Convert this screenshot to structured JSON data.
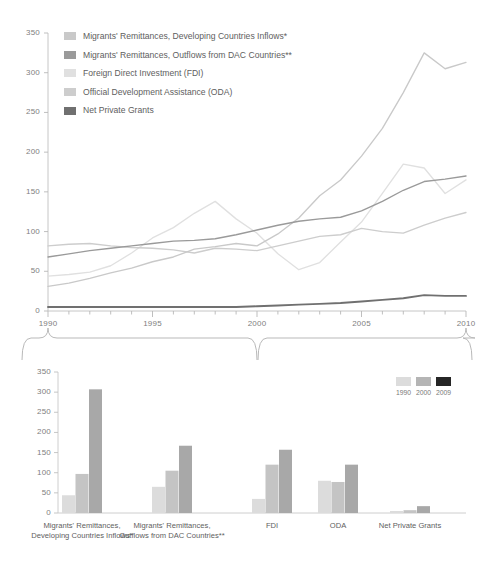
{
  "figure": {
    "kind": "two-panel-financial-flows-figure",
    "panels": 2
  },
  "legend_top": {
    "items": [
      {
        "label": "Migrants' Remittances, Developing Countries Inflows*",
        "color": "#c9c9c9",
        "name": "remittances-inflows"
      },
      {
        "label": "Migrants' Remittances, Outflows from DAC Countries**",
        "color": "#9a9a9a",
        "name": "remittances-outflows"
      },
      {
        "label": "Foreign Direct Investment (FDI)",
        "color": "#e0e0e0",
        "name": "fdi"
      },
      {
        "label": "Official Development Assistance (ODA)",
        "color": "#cdcdcd",
        "name": "oda"
      },
      {
        "label": "Net Private Grants",
        "color": "#707070",
        "name": "net-private-grants"
      }
    ]
  },
  "legend_bottom": {
    "years": [
      "1990",
      "2000",
      "2009"
    ],
    "colors": [
      "#dcdcdc",
      "#b5b5b5",
      "#262626"
    ]
  },
  "chart_data": [
    {
      "type": "line",
      "name": "line-panel",
      "title": "",
      "xlabel": "",
      "ylabel": "",
      "xlim": [
        1990,
        2010
      ],
      "ylim": [
        0,
        350
      ],
      "yticks": [
        0,
        50,
        100,
        150,
        200,
        250,
        300,
        350
      ],
      "ytick_labels": [
        "0",
        "50",
        "100",
        "150",
        "200",
        "250",
        "300",
        "350"
      ],
      "xticks": [
        1990,
        1991,
        1992,
        1993,
        1994,
        1995,
        1996,
        1997,
        1998,
        1999,
        2000,
        2001,
        2002,
        2003,
        2004,
        2005,
        2006,
        2007,
        2008,
        2009,
        2010
      ],
      "xtick_labels_shown": [
        "1990",
        "1995",
        "2000",
        "2005",
        "2010"
      ],
      "grid": false,
      "legend_position": "top-left",
      "x": [
        1990,
        1991,
        1992,
        1993,
        1994,
        1995,
        1996,
        1997,
        1998,
        1999,
        2000,
        2001,
        2002,
        2003,
        2004,
        2005,
        2006,
        2007,
        2008,
        2009,
        2010
      ],
      "series": [
        {
          "name": "Migrants' Remittances, Developing Countries Inflows*",
          "color": "#c9c9c9",
          "values": [
            31,
            35,
            41,
            48,
            54,
            62,
            68,
            78,
            81,
            85,
            82,
            97,
            117,
            145,
            165,
            195,
            230,
            275,
            325,
            305,
            313
          ]
        },
        {
          "name": "Migrants' Remittances, Outflows from DAC Countries**",
          "color": "#9a9a9a",
          "values": [
            68,
            72,
            76,
            79,
            82,
            85,
            88,
            89,
            91,
            96,
            102,
            108,
            113,
            116,
            118,
            126,
            138,
            152,
            163,
            166,
            170
          ]
        },
        {
          "name": "Foreign Direct Investment (FDI)",
          "color": "#e0e0e0",
          "values": [
            44,
            46,
            49,
            57,
            73,
            92,
            105,
            123,
            138,
            116,
            98,
            72,
            52,
            61,
            87,
            112,
            148,
            185,
            180,
            148,
            165
          ]
        },
        {
          "name": "Official Development Assistance (ODA)",
          "color": "#cdcdcd",
          "values": [
            82,
            84,
            85,
            82,
            80,
            79,
            77,
            73,
            79,
            78,
            76,
            82,
            88,
            94,
            96,
            104,
            100,
            98,
            108,
            117,
            124
          ]
        },
        {
          "name": "Net Private Grants",
          "color": "#707070",
          "values": [
            5,
            5,
            5,
            5,
            5,
            5,
            5,
            5,
            5,
            5,
            6,
            7,
            8,
            9,
            10,
            12,
            14,
            16,
            20,
            19,
            19
          ]
        }
      ]
    },
    {
      "type": "bar",
      "name": "bar-panel",
      "title": "",
      "xlabel": "",
      "ylabel": "",
      "ylim": [
        0,
        350
      ],
      "yticks": [
        0,
        50,
        100,
        150,
        200,
        250,
        300,
        350
      ],
      "ytick_labels": [
        "0",
        "50",
        "100",
        "150",
        "200",
        "250",
        "300",
        "350"
      ],
      "grid": false,
      "legend_position": "top-right",
      "categories": [
        "Migrants' Remittances,\nDeveloping Countries Inflows*",
        "Migrants' Remittances,\nOutflows from DAC Countries**",
        "FDI",
        "ODA",
        "Net Private Grants"
      ],
      "category_labels": [
        [
          "Migrants' Remittances,",
          "Developing Countries Inflows*"
        ],
        [
          "Migrants' Remittances,",
          "Outflows from DAC Countries**"
        ],
        [
          "FDI"
        ],
        [
          "ODA"
        ],
        [
          "Net Private Grants"
        ]
      ],
      "series": [
        {
          "name": "1990",
          "color": "#dcdcdc",
          "values": [
            44,
            65,
            35,
            80,
            5
          ]
        },
        {
          "name": "2000",
          "color": "#c4c4c4",
          "values": [
            97,
            105,
            120,
            77,
            7
          ]
        },
        {
          "name": "2009",
          "color": "#a8a8a8",
          "values": [
            307,
            167,
            157,
            120,
            17
          ]
        }
      ]
    }
  ],
  "braces": {
    "count": 2,
    "note": "curly connectors linking 1990, 2000 and 2010 on the line axis down to the bar panel"
  }
}
